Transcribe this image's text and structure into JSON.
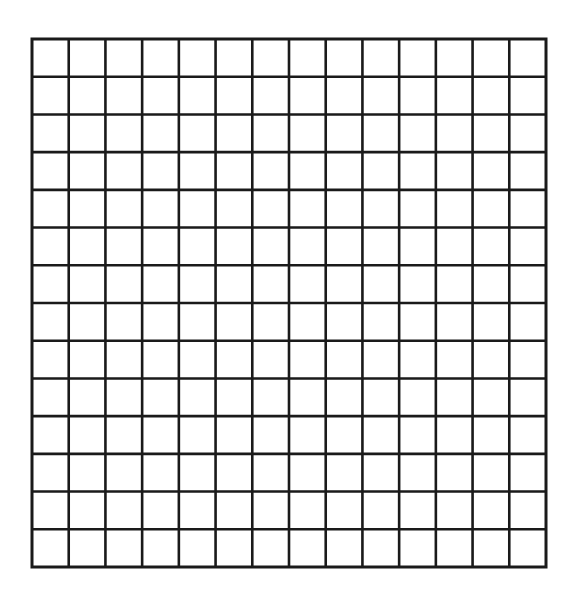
{
  "diagram": {
    "type": "blank-grid",
    "rows": 14,
    "columns": 14,
    "bounds": {
      "left": 32,
      "top": 39,
      "right": 546,
      "bottom": 567
    },
    "line_color": "#1a1a1a",
    "line_width": 2.6,
    "background_color": "#ffffff"
  }
}
